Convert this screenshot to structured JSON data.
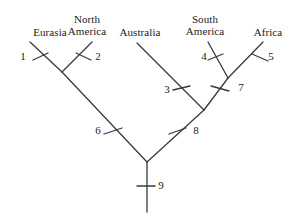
{
  "figure": {
    "kind": "phylogenetic-tree",
    "background_color": "#ffffff",
    "line_color": "#3a3a3a",
    "text_color": "#1b1b1b",
    "width": 295,
    "height": 216
  },
  "taxa": [
    {
      "id": "eurasia",
      "label": "Eurasia",
      "x": 28,
      "y": 26,
      "w": 44,
      "tip_x": 30,
      "tip_y": 42
    },
    {
      "id": "north-america",
      "label": "North\nAmerica",
      "x": 62,
      "y": 13,
      "w": 50,
      "tip_x": 92,
      "tip_y": 42
    },
    {
      "id": "australia",
      "label": "Australia",
      "x": 113,
      "y": 26,
      "w": 54,
      "tip_x": 137,
      "tip_y": 43
    },
    {
      "id": "south-america",
      "label": "South\nAmerica",
      "x": 180,
      "y": 13,
      "w": 50,
      "tip_x": 208,
      "tip_y": 42
    },
    {
      "id": "africa",
      "label": "Africa",
      "x": 248,
      "y": 26,
      "w": 40,
      "tip_x": 263,
      "tip_y": 42
    }
  ],
  "branch_numbers": [
    {
      "id": "n1",
      "label": "1",
      "x": 17,
      "y": 51
    },
    {
      "id": "n2",
      "label": "2",
      "x": 92,
      "y": 51
    },
    {
      "id": "n3",
      "label": "3",
      "x": 161,
      "y": 84
    },
    {
      "id": "n4",
      "label": "4",
      "x": 198,
      "y": 51
    },
    {
      "id": "n5",
      "label": "5",
      "x": 265,
      "y": 51
    },
    {
      "id": "n6",
      "label": "6",
      "x": 92,
      "y": 125
    },
    {
      "id": "n7",
      "label": "7",
      "x": 235,
      "y": 82
    },
    {
      "id": "n8",
      "label": "8",
      "x": 190,
      "y": 125
    },
    {
      "id": "n9",
      "label": "9",
      "x": 155,
      "y": 180
    }
  ],
  "branches": [
    {
      "id": "branch-1-eurasia",
      "x1": 30,
      "y1": 42,
      "x2": 62,
      "y2": 72
    },
    {
      "id": "branch-2-north-america",
      "x1": 92,
      "y1": 42,
      "x2": 62,
      "y2": 72
    },
    {
      "id": "branch-6-laurasia",
      "x1": 62,
      "y1": 72,
      "x2": 147,
      "y2": 162
    },
    {
      "id": "branch-3-australia",
      "x1": 137,
      "y1": 43,
      "x2": 204,
      "y2": 110
    },
    {
      "id": "branch-4-south-america",
      "x1": 208,
      "y1": 42,
      "x2": 228,
      "y2": 78
    },
    {
      "id": "branch-5-africa",
      "x1": 263,
      "y1": 42,
      "x2": 228,
      "y2": 78
    },
    {
      "id": "branch-7-gondwana-right",
      "x1": 228,
      "y1": 78,
      "x2": 204,
      "y2": 110
    },
    {
      "id": "branch-8-gondwana",
      "x1": 204,
      "y1": 110,
      "x2": 147,
      "y2": 162
    },
    {
      "id": "branch-9-root-stem",
      "x1": 147,
      "y1": 162,
      "x2": 147,
      "y2": 212
    }
  ],
  "tick_marks": [
    {
      "id": "tick-1",
      "x1": 33,
      "y1": 60,
      "x2": 48,
      "y2": 53
    },
    {
      "id": "tick-2",
      "x1": 76,
      "y1": 53,
      "x2": 91,
      "y2": 60
    },
    {
      "id": "tick-3",
      "x1": 173,
      "y1": 90,
      "x2": 190,
      "y2": 86
    },
    {
      "id": "tick-4",
      "x1": 208,
      "y1": 60,
      "x2": 223,
      "y2": 54
    },
    {
      "id": "tick-5",
      "x1": 252,
      "y1": 54,
      "x2": 268,
      "y2": 61
    },
    {
      "id": "tick-6",
      "x1": 104,
      "y1": 134,
      "x2": 122,
      "y2": 128
    },
    {
      "id": "tick-7",
      "x1": 211,
      "y1": 86,
      "x2": 229,
      "y2": 91
    },
    {
      "id": "tick-8",
      "x1": 169,
      "y1": 134,
      "x2": 186,
      "y2": 128
    },
    {
      "id": "tick-9",
      "x1": 137,
      "y1": 186,
      "x2": 155,
      "y2": 186
    }
  ]
}
